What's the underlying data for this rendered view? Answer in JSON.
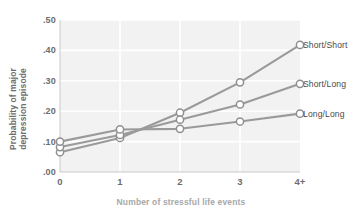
{
  "chart_data": {
    "type": "line",
    "title": "",
    "xlabel": "Number of stressful life events",
    "ylabel_lines": [
      "Probability of major",
      "depression episode"
    ],
    "ylabel": "Probability of major depression episode",
    "categories": [
      "0",
      "1",
      "2",
      "3",
      "4+"
    ],
    "x": [
      0,
      1,
      2,
      3,
      4
    ],
    "ylim": [
      0.0,
      0.5
    ],
    "xlim": [
      0,
      4
    ],
    "yticks": [
      0.0,
      0.1,
      0.2,
      0.3,
      0.4,
      0.5
    ],
    "ytick_labels": [
      ".00",
      ".10",
      ".20",
      ".30",
      ".40",
      ".50"
    ],
    "xtick_labels": [
      "0",
      "1",
      "2",
      "3",
      "4+"
    ],
    "grid": true,
    "grid_color": "#ffffff",
    "plot_background": "#f2f2f2",
    "legend_position": "right-of-axes",
    "line_color": "#9a9a9a",
    "marker_face_color": "#ffffff",
    "marker_edge_color": "#8f8f8f",
    "series": [
      {
        "name": "Short/Short",
        "values": [
          0.065,
          0.112,
          0.195,
          0.295,
          0.418
        ]
      },
      {
        "name": "Short/Long",
        "values": [
          0.082,
          0.122,
          0.172,
          0.222,
          0.29
        ]
      },
      {
        "name": "Long/Long",
        "values": [
          0.1,
          0.14,
          0.142,
          0.166,
          0.192
        ]
      }
    ]
  }
}
